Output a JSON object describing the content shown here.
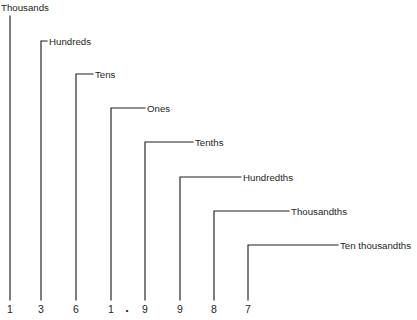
{
  "diagram": {
    "number": "1361.9987",
    "decimal_separator": ".",
    "ink_color": "#231f20",
    "background_color": "#ffffff",
    "columns": [
      {
        "id": "thousands",
        "label": "Thousands",
        "digit": "1",
        "digit_x": 10,
        "line_x": 10,
        "elbow_y": 16,
        "label_x": 1,
        "label_y": 11,
        "horizontal_end_x": 10,
        "has_elbow": false
      },
      {
        "id": "hundreds",
        "label": "Hundreds",
        "digit": "3",
        "digit_x": 41,
        "line_x": 41,
        "elbow_y": 41,
        "label_x": 49,
        "label_y": 44.5,
        "horizontal_end_x": 47,
        "has_elbow": true
      },
      {
        "id": "tens",
        "label": "Tens",
        "digit": "6",
        "digit_x": 76,
        "line_x": 76,
        "elbow_y": 74,
        "label_x": 95,
        "label_y": 77.5,
        "horizontal_end_x": 93,
        "has_elbow": true
      },
      {
        "id": "ones",
        "label": "Ones",
        "digit": "1",
        "digit_x": 111,
        "line_x": 111,
        "elbow_y": 108,
        "label_x": 147,
        "label_y": 111.5,
        "horizontal_end_x": 145,
        "has_elbow": true
      },
      {
        "id": "tenths",
        "label": "Tenths",
        "digit": "9",
        "digit_x": 145,
        "line_x": 145,
        "elbow_y": 142,
        "label_x": 195,
        "label_y": 145.5,
        "horizontal_end_x": 193,
        "has_elbow": true
      },
      {
        "id": "hundredths",
        "label": "Hundredths",
        "digit": "9",
        "digit_x": 180,
        "line_x": 180,
        "elbow_y": 177,
        "label_x": 243,
        "label_y": 180.5,
        "horizontal_end_x": 241,
        "has_elbow": true
      },
      {
        "id": "thousandths",
        "label": "Thousandths",
        "digit": "8",
        "digit_x": 214,
        "line_x": 214,
        "elbow_y": 211,
        "label_x": 291,
        "label_y": 214.5,
        "horizontal_end_x": 289,
        "has_elbow": true
      },
      {
        "id": "ten-thousandths",
        "label": "Ten thousandths",
        "digit": "7",
        "digit_x": 248,
        "line_x": 248,
        "elbow_y": 245,
        "label_x": 340,
        "label_y": 248.5,
        "horizontal_end_x": 338,
        "has_elbow": true
      }
    ],
    "decimal_point": {
      "glyph": ".",
      "x": 127,
      "y": 312
    },
    "baseline_y": 300,
    "digit_baseline_y": 313
  }
}
